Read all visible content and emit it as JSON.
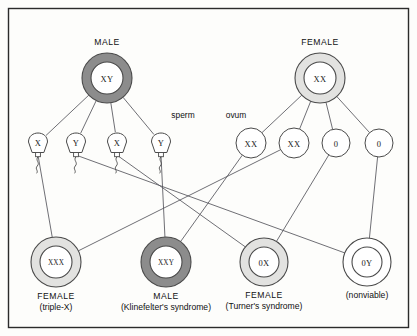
{
  "figure": {
    "border_color": "#2b2b2b",
    "background": "#fdfdfb",
    "line_color": "#55555c"
  },
  "colors": {
    "dark_ring": "#8c8c8c",
    "light_ring": "#e2e2e0",
    "white_ring": "#ffffff",
    "stroke": "#4a4a4a",
    "text": "#111111"
  },
  "parents": [
    {
      "id": "parent-male",
      "caption": "MALE",
      "genotype": "XY",
      "ring": "dark",
      "ring_color": "#8c8c8c",
      "cx": 107,
      "cy": 78,
      "r_outer": 25,
      "r_inner": 16
    },
    {
      "id": "parent-female",
      "caption": "FEMALE",
      "genotype": "XX",
      "ring": "light",
      "ring_color": "#e2e2e0",
      "cx": 320,
      "cy": 78,
      "r_outer": 25,
      "r_inner": 16
    }
  ],
  "gamete_labels": [
    {
      "id": "sperm-label",
      "text": "sperm",
      "x": 183,
      "y": 118
    },
    {
      "id": "ovum-label",
      "text": "ovum",
      "x": 236,
      "y": 118
    }
  ],
  "sperm": [
    {
      "id": "sperm-1",
      "genotype": "X",
      "cx": 38,
      "cy": 143
    },
    {
      "id": "sperm-2",
      "genotype": "Y",
      "cx": 76,
      "cy": 143
    },
    {
      "id": "sperm-3",
      "genotype": "X",
      "cx": 117,
      "cy": 143
    },
    {
      "id": "sperm-4",
      "genotype": "Y",
      "cx": 161,
      "cy": 143
    }
  ],
  "ova": [
    {
      "id": "ovum-1",
      "genotype": "XX",
      "cx": 251,
      "cy": 143,
      "r": 15
    },
    {
      "id": "ovum-2",
      "genotype": "XX",
      "cx": 294,
      "cy": 143,
      "r": 15
    },
    {
      "id": "ovum-3",
      "genotype": "0",
      "cx": 336,
      "cy": 143,
      "r": 14
    },
    {
      "id": "ovum-4",
      "genotype": "0",
      "cx": 379,
      "cy": 143,
      "r": 14
    }
  ],
  "offspring": [
    {
      "id": "offspring-xxx",
      "genotype": "XXX",
      "ring": "light",
      "ring_color": "#e2e2e0",
      "cx": 56,
      "cy": 262,
      "r_outer": 25,
      "r_inner": 16,
      "label_line1": "FEMALE",
      "label_line2": "(triple-X)"
    },
    {
      "id": "offspring-xxy",
      "genotype": "XXY",
      "ring": "dark",
      "ring_color": "#8c8c8c",
      "cx": 166,
      "cy": 262,
      "r_outer": 25,
      "r_inner": 16,
      "label_line1": "MALE",
      "label_line2": "(Klinefelter's syndrome)"
    },
    {
      "id": "offspring-0x",
      "genotype": "0X",
      "ring": "light",
      "ring_color": "#e2e2e0",
      "cx": 264,
      "cy": 262,
      "r_outer": 24,
      "r_inner": 15,
      "label_line1": "FEMALE",
      "label_line2": "(Turner's syndrome)"
    },
    {
      "id": "offspring-0y",
      "genotype": "0Y",
      "ring": "white",
      "ring_color": "#ffffff",
      "cx": 367,
      "cy": 262,
      "r_outer": 24,
      "r_inner": 15,
      "label_line1": "",
      "label_line2": "(nonviable)"
    }
  ],
  "edges": {
    "male_to_sperm": [
      {
        "from": "parent-male",
        "to": "sperm-1"
      },
      {
        "from": "parent-male",
        "to": "sperm-2"
      },
      {
        "from": "parent-male",
        "to": "sperm-3"
      },
      {
        "from": "parent-male",
        "to": "sperm-4"
      }
    ],
    "female_to_ova": [
      {
        "from": "parent-female",
        "to": "ovum-1"
      },
      {
        "from": "parent-female",
        "to": "ovum-2"
      },
      {
        "from": "parent-female",
        "to": "ovum-3"
      },
      {
        "from": "parent-female",
        "to": "ovum-4"
      }
    ],
    "fertilization": [
      {
        "from": "sperm-1",
        "to": "offspring-xxx"
      },
      {
        "from": "sperm-2",
        "to": "offspring-0y"
      },
      {
        "from": "sperm-3",
        "to": "offspring-0x"
      },
      {
        "from": "sperm-4",
        "to": "offspring-xxy"
      },
      {
        "from": "ovum-1",
        "to": "offspring-xxy"
      },
      {
        "from": "ovum-2",
        "to": "offspring-xxx"
      },
      {
        "from": "ovum-3",
        "to": "offspring-0x"
      },
      {
        "from": "ovum-4",
        "to": "offspring-0y"
      }
    ]
  }
}
